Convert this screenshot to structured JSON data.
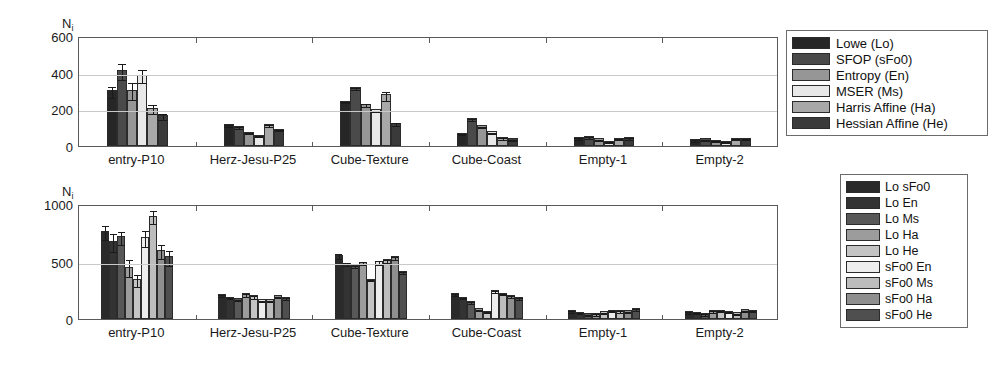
{
  "chart_data": [
    {
      "type": "bar",
      "panel": "top",
      "title": "",
      "xlabel": "",
      "ylabel": "N_i",
      "ylabel_base": "N",
      "ylabel_sub": "i",
      "ylim": [
        0,
        600
      ],
      "yticks": [
        0,
        200,
        400,
        600
      ],
      "ytick_labels": [
        "0",
        "200",
        "400",
        "600"
      ],
      "grid": true,
      "legend_position": "right-outside",
      "categories": [
        "entry-P10",
        "Herz-Jesu-P25",
        "Cube-Texture",
        "Cube-Coast",
        "Empty-1",
        "Empty-2"
      ],
      "series": [
        {
          "name": "Lowe (Lo)",
          "color": "#262626",
          "values": [
            305,
            120,
            248,
            72,
            48,
            38
          ],
          "errors": [
            30,
            4,
            4,
            3,
            4,
            3
          ]
        },
        {
          "name": "SFOP (sFo0)",
          "color": "#4a4a4a",
          "values": [
            415,
            110,
            322,
            152,
            55,
            42
          ],
          "errors": [
            43,
            4,
            8,
            4,
            4,
            3
          ]
        },
        {
          "name": "Entropy (En)",
          "color": "#969696",
          "values": [
            308,
            78,
            230,
            112,
            42,
            35
          ],
          "errors": [
            45,
            3,
            8,
            4,
            3,
            3
          ]
        },
        {
          "name": "MSER (Ms)",
          "color": "#e8e8e8",
          "values": [
            390,
            62,
            200,
            80,
            30,
            28
          ],
          "errors": [
            38,
            3,
            4,
            3,
            3,
            3
          ]
        },
        {
          "name": "Harris Affine (Ha)",
          "color": "#a8a8a8",
          "values": [
            210,
            118,
            282,
            50,
            45,
            44
          ],
          "errors": [
            22,
            5,
            25,
            4,
            4,
            3
          ]
        },
        {
          "name": "Hessian Affine (He)",
          "color": "#3a3a3a",
          "values": [
            168,
            95,
            128,
            42,
            48,
            46
          ],
          "errors": [
            16,
            4,
            10,
            3,
            4,
            3
          ]
        }
      ]
    },
    {
      "type": "bar",
      "panel": "bottom",
      "title": "",
      "xlabel": "",
      "ylabel": "N_i",
      "ylabel_base": "N",
      "ylabel_sub": "i",
      "ylim": [
        0,
        1000
      ],
      "yticks": [
        0,
        500,
        1000
      ],
      "ytick_labels": [
        "0",
        "500",
        "1000"
      ],
      "grid": true,
      "legend_position": "right-outside",
      "categories": [
        "entry-P10",
        "Herz-Jesu-P25",
        "Cube-Texture",
        "Cube-Coast",
        "Empty-1",
        "Empty-2"
      ],
      "series": [
        {
          "name": "Lo sFo0",
          "color": "#2a2a2a",
          "values": [
            765,
            215,
            560,
            225,
            78,
            70
          ],
          "errors": [
            62,
            8,
            22,
            8,
            6,
            5
          ]
        },
        {
          "name": "Lo En",
          "color": "#333333",
          "values": [
            675,
            195,
            490,
            195,
            62,
            62
          ],
          "errors": [
            78,
            6,
            12,
            6,
            5,
            5
          ]
        },
        {
          "name": "Lo Ms",
          "color": "#585858",
          "values": [
            720,
            180,
            470,
            155,
            50,
            52
          ],
          "errors": [
            55,
            6,
            10,
            6,
            5,
            5
          ]
        },
        {
          "name": "Lo Ha",
          "color": "#9c9c9c",
          "values": [
            455,
            225,
            500,
            95,
            52,
            78
          ],
          "errors": [
            72,
            14,
            12,
            5,
            5,
            5
          ]
        },
        {
          "name": "Lo He",
          "color": "#c4c4c4",
          "values": [
            345,
            205,
            350,
            72,
            68,
            82
          ],
          "errors": [
            52,
            10,
            6,
            5,
            5,
            5
          ]
        },
        {
          "name": "sFo0 En",
          "color": "#ededed",
          "values": [
            715,
            170,
            505,
            250,
            80,
            72
          ],
          "errors": [
            68,
            6,
            16,
            8,
            5,
            5
          ]
        },
        {
          "name": "sFo0 Ms",
          "color": "#bdbdbd",
          "values": [
            900,
            170,
            520,
            230,
            78,
            60
          ],
          "errors": [
            58,
            6,
            14,
            7,
            5,
            5
          ]
        },
        {
          "name": "sFo0 Ha",
          "color": "#8f8f8f",
          "values": [
            600,
            205,
            545,
            210,
            75,
            85
          ],
          "errors": [
            62,
            7,
            14,
            7,
            5,
            5
          ]
        },
        {
          "name": "sFo0 He",
          "color": "#4f4f4f",
          "values": [
            545,
            190,
            415,
            190,
            95,
            80
          ],
          "errors": [
            68,
            7,
            8,
            7,
            6,
            5
          ]
        }
      ]
    }
  ],
  "legend_top": {
    "items": [
      {
        "label": "Lowe (Lo)",
        "color": "#262626"
      },
      {
        "label": "SFOP (sFo0)",
        "color": "#4a4a4a"
      },
      {
        "label": "Entropy (En)",
        "color": "#969696"
      },
      {
        "label": "MSER (Ms)",
        "color": "#e8e8e8"
      },
      {
        "label": "Harris Affine (Ha)",
        "color": "#a8a8a8"
      },
      {
        "label": "Hessian Affine (He)",
        "color": "#3a3a3a"
      }
    ]
  },
  "legend_bottom": {
    "items": [
      {
        "label": "Lo sFo0",
        "color": "#2a2a2a"
      },
      {
        "label": "Lo En",
        "color": "#333333"
      },
      {
        "label": "Lo Ms",
        "color": "#585858"
      },
      {
        "label": "Lo Ha",
        "color": "#9c9c9c"
      },
      {
        "label": "Lo He",
        "color": "#c4c4c4"
      },
      {
        "label": "sFo0 En",
        "color": "#ededed"
      },
      {
        "label": "sFo0 Ms",
        "color": "#bdbdbd"
      },
      {
        "label": "sFo0 Ha",
        "color": "#8f8f8f"
      },
      {
        "label": "sFo0 He",
        "color": "#4f4f4f"
      }
    ]
  }
}
